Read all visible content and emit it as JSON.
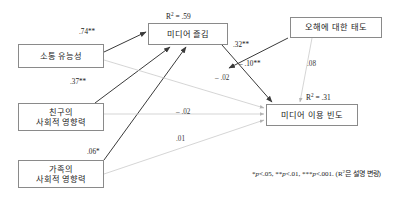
{
  "figure": {
    "type": "path-diagram"
  },
  "nodes": [
    {
      "id": "communication_competence",
      "lines": [
        "소통 유능성"
      ],
      "x": 18,
      "y": 44,
      "w": 86,
      "h": 24
    },
    {
      "id": "friend_social_influence",
      "lines": [
        "친구의",
        "사회적 영향력"
      ],
      "x": 18,
      "y": 103,
      "w": 86,
      "h": 28
    },
    {
      "id": "family_social_influence",
      "lines": [
        "가족의",
        "사회적 영향력"
      ],
      "x": 18,
      "y": 160,
      "w": 86,
      "h": 28
    },
    {
      "id": "media_enjoyment",
      "lines": [
        "미디어 즐김"
      ],
      "x": 148,
      "y": 23,
      "w": 80,
      "h": 22
    },
    {
      "id": "attitude_toward_misunderstanding",
      "lines": [
        "오해에 대한 태도"
      ],
      "x": 290,
      "y": 17,
      "w": 92,
      "h": 21
    },
    {
      "id": "media_use_frequency",
      "lines": [
        "미디어 이용 빈도"
      ],
      "x": 266,
      "y": 104,
      "w": 92,
      "h": 22
    }
  ],
  "r2_labels": [
    {
      "id": "r2-media-enjoyment",
      "text": "R",
      "sup": "2",
      "rest": "= .59",
      "x": 166,
      "y": 11
    },
    {
      "id": "r2-media-use",
      "text": "R",
      "sup": "2",
      "rest": "= .31",
      "x": 306,
      "y": 92
    }
  ],
  "coefficients": [
    {
      "id": "comm-to-enjoyment",
      "value": ".74**",
      "x": 79,
      "y": 28,
      "significant": true
    },
    {
      "id": "friend-to-enjoyment",
      "value": ".37**",
      "x": 70,
      "y": 78,
      "significant": true
    },
    {
      "id": "family-to-enjoyment",
      "value": ".06*",
      "x": 87,
      "y": 148,
      "significant": true
    },
    {
      "id": "enjoyment-to-use",
      "value": ".32**",
      "x": 233,
      "y": 41,
      "significant": true
    },
    {
      "id": "attitude-to-enjoyment",
      "value": "– .10**",
      "x": 239,
      "y": 60,
      "significant": true
    },
    {
      "id": "attitude-to-use",
      "value": ".08",
      "x": 307,
      "y": 60,
      "significant": false
    },
    {
      "id": "comm-to-use",
      "value": "– .02",
      "x": 215,
      "y": 74,
      "significant": false
    },
    {
      "id": "friend-to-use",
      "value": "– .02",
      "x": 176,
      "y": 108,
      "significant": false
    },
    {
      "id": "family-to-use",
      "value": ".01",
      "x": 176,
      "y": 135,
      "significant": false
    }
  ],
  "footnote": {
    "x": 252,
    "y": 168,
    "parts": [
      {
        "t": "*",
        "italic": false
      },
      {
        "t": "p",
        "italic": true
      },
      {
        "t": "<.05, **",
        "italic": false
      },
      {
        "t": "p",
        "italic": true
      },
      {
        "t": "<.01, ***",
        "italic": false
      },
      {
        "t": "p",
        "italic": true
      },
      {
        "t": "<.001. (R",
        "italic": false
      },
      {
        "t": "2",
        "sup": true
      },
      {
        "t": "은 설명 변량)",
        "italic": false
      }
    ],
    "plain": "*p<.05, **p<.01, ***p<.001. (R2은 설명 변량)"
  },
  "colors": {
    "box_border": "#8a8a8a",
    "text": "#1a1a1a",
    "path_significant": "#3a3a3a",
    "path_nonsignificant": "#c3c3c3",
    "background": "#ffffff"
  },
  "paths": [
    {
      "id": "comm-to-enjoyment",
      "from": "communication_competence",
      "to": "media_enjoyment",
      "x1": 104,
      "y1": 52,
      "x2": 146,
      "y2": 32,
      "significant": true
    },
    {
      "id": "friend-to-enjoyment",
      "from": "friend_social_influence",
      "to": "media_enjoyment",
      "x1": 95,
      "y1": 103,
      "x2": 170,
      "y2": 47,
      "significant": true
    },
    {
      "id": "family-to-enjoyment",
      "from": "family_social_influence",
      "to": "media_enjoyment",
      "x1": 104,
      "y1": 160,
      "x2": 186,
      "y2": 47,
      "significant": true
    },
    {
      "id": "enjoyment-to-use",
      "from": "media_enjoyment",
      "to": "media_use_frequency",
      "x1": 222,
      "y1": 45,
      "x2": 272,
      "y2": 102,
      "significant": true
    },
    {
      "id": "attitude-to-enjoyment",
      "from": "attitude_toward_misunderstanding",
      "to": "media_enjoyment",
      "x1": 288,
      "y1": 38,
      "x2": 229,
      "y2": 68,
      "significant": true
    },
    {
      "id": "attitude-to-use",
      "from": "attitude_toward_misunderstanding",
      "to": "media_use_frequency",
      "x1": 312,
      "y1": 38,
      "x2": 300,
      "y2": 102,
      "significant": false
    },
    {
      "id": "comm-to-use",
      "from": "communication_competence",
      "to": "media_use_frequency",
      "x1": 104,
      "y1": 60,
      "x2": 264,
      "y2": 108,
      "significant": false
    },
    {
      "id": "friend-to-use",
      "from": "friend_social_influence",
      "to": "media_use_frequency",
      "x1": 104,
      "y1": 114,
      "x2": 264,
      "y2": 114,
      "significant": false
    },
    {
      "id": "family-to-use",
      "from": "family_social_influence",
      "to": "media_use_frequency",
      "x1": 104,
      "y1": 174,
      "x2": 264,
      "y2": 120,
      "significant": false
    }
  ]
}
